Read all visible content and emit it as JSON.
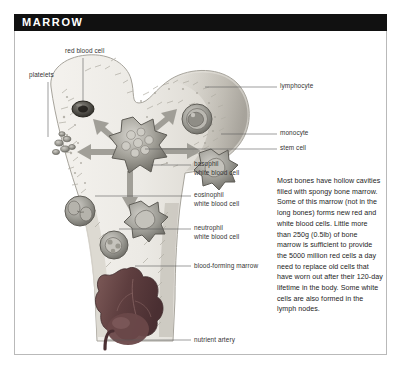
{
  "panel": {
    "title": "MARROW",
    "border_color": "#b9b9b9",
    "title_bar_color": "#111111",
    "title_text_color": "#ffffff"
  },
  "illustration": {
    "subject": "femur-bone-cross-section",
    "bone_fill": "#ebe9e4",
    "marrow_fill": "#6d4a4a",
    "arrow_fill": "#9a9a94",
    "cell_fill": "#8e8e88",
    "labels": [
      {
        "id": "platelets",
        "text": "platelets",
        "x": 14,
        "y": 44,
        "align": "left"
      },
      {
        "id": "red-blood-cell",
        "text": "red blood cell",
        "x": 62,
        "y": 20,
        "align": "left"
      },
      {
        "id": "lymphocyte",
        "text": "lymphocyte",
        "x": 264,
        "y": 53,
        "align": "left"
      },
      {
        "id": "monocyte",
        "text": "monocyte",
        "x": 264,
        "y": 100,
        "align": "left"
      },
      {
        "id": "stem-cell",
        "text": "stem cell",
        "x": 264,
        "y": 115,
        "align": "left"
      },
      {
        "id": "basophil",
        "text": "basophil",
        "x": 178,
        "y": 131,
        "align": "left"
      },
      {
        "id": "basophil-2",
        "text": "white blood cell",
        "x": 178,
        "y": 139,
        "align": "left"
      },
      {
        "id": "eosinophil",
        "text": "eosinophil",
        "x": 178,
        "y": 162,
        "align": "left"
      },
      {
        "id": "eosinophil-2",
        "text": "white blood cell",
        "x": 178,
        "y": 170,
        "align": "left"
      },
      {
        "id": "neutrophil",
        "text": "neutrophil",
        "x": 178,
        "y": 195,
        "align": "left"
      },
      {
        "id": "neutrophil-2",
        "text": "white blood cell",
        "x": 178,
        "y": 203,
        "align": "left"
      },
      {
        "id": "blood-forming-marrow",
        "text": "blood-forming marrow",
        "x": 178,
        "y": 232,
        "align": "left"
      },
      {
        "id": "nutrient-artery",
        "text": "nutrient artery",
        "x": 178,
        "y": 306,
        "align": "left"
      }
    ]
  },
  "description": {
    "text": "Most bones have hollow cavities filled with spongy bone marrow. Some of this marrow (not in the long bones) forms new red and white blood cells. Little more than 250g (0.5lb) of bone marrow is sufficient to provide the 5000 million red cells a day need to replace old cells that have worn out after their 120-day lifetime in the body. Some white cells are also formed in the lymph nodes."
  }
}
